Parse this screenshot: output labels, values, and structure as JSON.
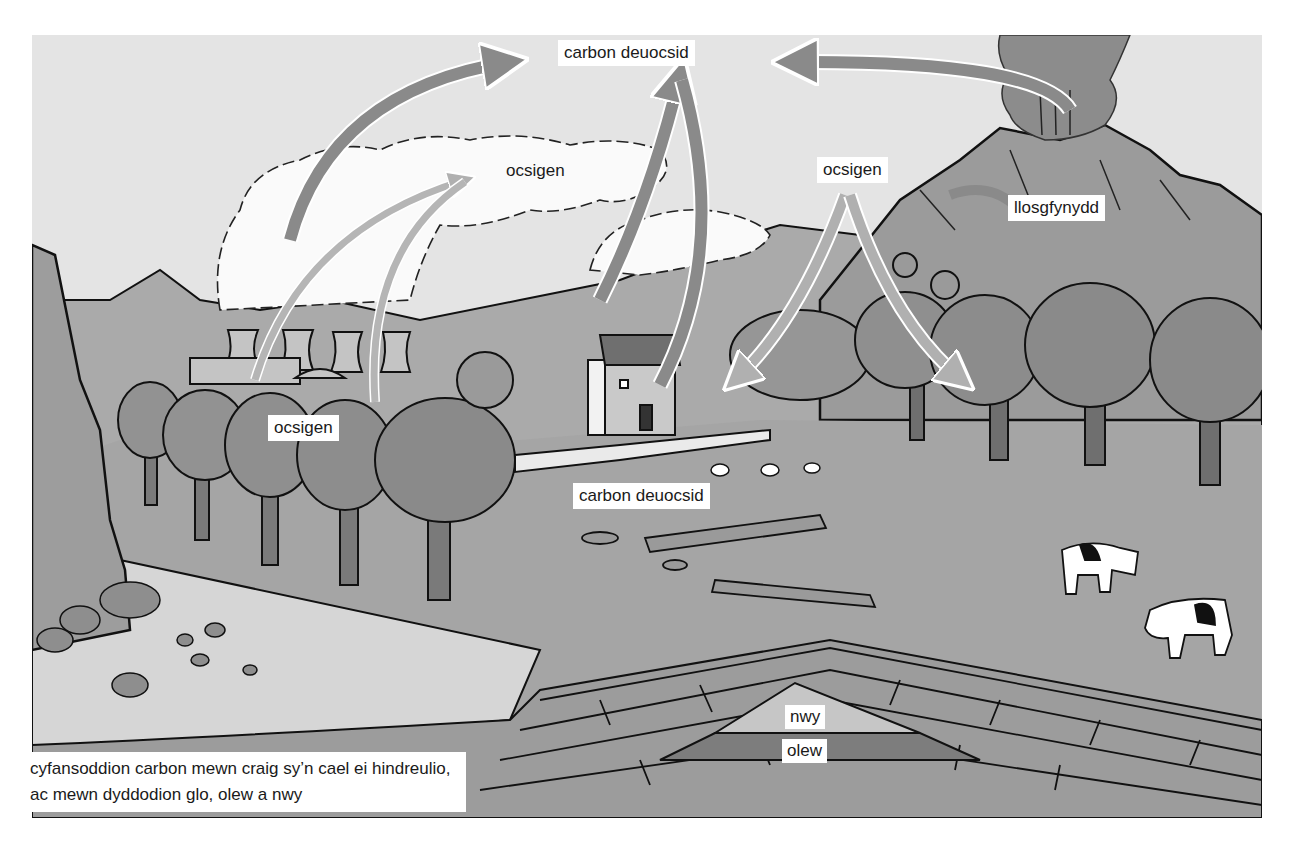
{
  "diagram": {
    "type": "carbon-cycle-illustration",
    "language": "Welsh",
    "style": "grayscale illustrated landscape",
    "labels": {
      "co2_top": "carbon deuocsid",
      "oxygen_cloud": "ocsigen",
      "oxygen_trees_right": "ocsigen",
      "volcano": "llosgfynydd",
      "oxygen_trees_left": "ocsigen",
      "co2_ground": "carbon deuocsid",
      "gas": "nwy",
      "oil": "olew",
      "rock_compounds": "cyfansoddion carbon mewn craig sy’n cael ei hindreulio, ac mewn dyddodion glo, olew a nwy"
    },
    "arrows": [
      {
        "from": "power-station",
        "to": "carbon deuocsid",
        "meaning": "CO2 released"
      },
      {
        "from": "trees-left",
        "to": "ocsigen cloud",
        "meaning": "O2 released (2 arrows)"
      },
      {
        "from": "cottage-chimney",
        "to": "carbon deuocsid",
        "meaning": "CO2 released"
      },
      {
        "from": "carbon deuocsid",
        "to": "cottage",
        "meaning": "CO2 flow"
      },
      {
        "from": "volcano",
        "to": "carbon deuocsid",
        "meaning": "CO2 released"
      },
      {
        "from": "ocsigen",
        "to": "trees-right",
        "meaning": "O2 taken in (2 arrows)"
      }
    ],
    "scene_elements": [
      "power station cooling towers",
      "smoke clouds",
      "cottage with chimney",
      "volcano",
      "trees",
      "cows",
      "sheep",
      "fallen logs",
      "rock cliff",
      "boulders",
      "folded rock strata",
      "gas pocket",
      "oil layer"
    ]
  },
  "colors": {
    "sky": "#e4e4e4",
    "cloud": "#fafafa",
    "hills": "#a9a9a9",
    "volcano": "#9a9a9a",
    "trees": "#8f8f8f",
    "field": "#a5a5a5",
    "strata": "#9c9c9c",
    "gas": "#c6c6c6",
    "oil": "#7d7d7d",
    "arrow": "#8a8a8a",
    "arrow_light": "#b5b5b5",
    "label_bg": "#ffffff",
    "text": "#1a1a1a"
  }
}
